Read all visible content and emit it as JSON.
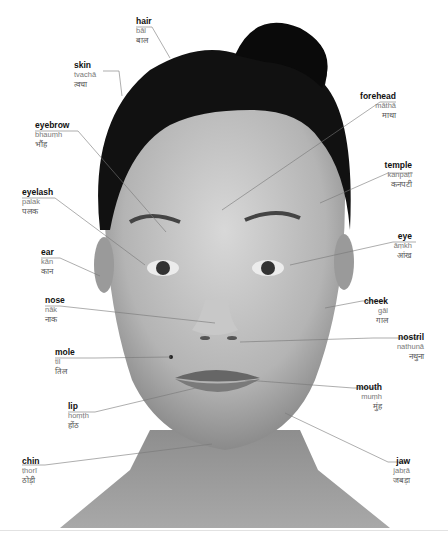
{
  "diagram": {
    "labels": [
      {
        "id": "hair",
        "en": "hair",
        "tr": "bāl",
        "hi": "बाल",
        "side": "left"
      },
      {
        "id": "skin",
        "en": "skin",
        "tr": "tvachā",
        "hi": "त्वचा",
        "side": "left"
      },
      {
        "id": "eyebrow",
        "en": "eyebrow",
        "tr": "bhauṃh",
        "hi": "भौंह",
        "side": "left"
      },
      {
        "id": "eyelash",
        "en": "eyelash",
        "tr": "palak",
        "hi": "पलक",
        "side": "left"
      },
      {
        "id": "ear",
        "en": "ear",
        "tr": "kān",
        "hi": "कान",
        "side": "left"
      },
      {
        "id": "nose",
        "en": "nose",
        "tr": "nāk",
        "hi": "नाक",
        "side": "left"
      },
      {
        "id": "mole",
        "en": "mole",
        "tr": "til",
        "hi": "तिल",
        "side": "left"
      },
      {
        "id": "lip",
        "en": "lip",
        "tr": "hoṃṭh",
        "hi": "होंठ",
        "side": "left"
      },
      {
        "id": "chin",
        "en": "chin",
        "tr": "ṭhorī",
        "hi": "ठोड़ी",
        "side": "left"
      },
      {
        "id": "forehead",
        "en": "forehead",
        "tr": "māthā",
        "hi": "माथा",
        "side": "right"
      },
      {
        "id": "temple",
        "en": "temple",
        "tr": "kanpaṭī",
        "hi": "कनपटी",
        "side": "right"
      },
      {
        "id": "eye",
        "en": "eye",
        "tr": "āṃkh",
        "hi": "आंख",
        "side": "right"
      },
      {
        "id": "cheek",
        "en": "cheek",
        "tr": "gāl",
        "hi": "गाल",
        "side": "right"
      },
      {
        "id": "nostril",
        "en": "nostril",
        "tr": "nathunā",
        "hi": "नथुना",
        "side": "right"
      },
      {
        "id": "mouth",
        "en": "mouth",
        "tr": "muṃh",
        "hi": "मुंह",
        "side": "right"
      },
      {
        "id": "jaw",
        "en": "jaw",
        "tr": "jabṛā",
        "hi": "जबड़ा",
        "side": "right"
      }
    ]
  },
  "footer": {
    "page": ""
  }
}
